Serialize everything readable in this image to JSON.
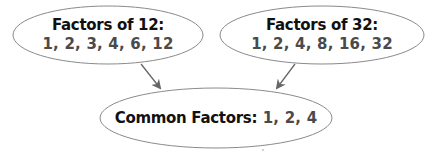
{
  "diagram": {
    "nodes": [
      {
        "id": "factors-12",
        "title": "Factors of 12:",
        "values": "1, 2, 3, 4, 6, 12"
      },
      {
        "id": "factors-32",
        "title": "Factors of 32:",
        "values": "1, 2, 4, 8, 16, 32"
      },
      {
        "id": "common",
        "title": "Common Factors:",
        "values": "1, 2, 4"
      }
    ],
    "edges": [
      {
        "from": "factors-12",
        "to": "common"
      },
      {
        "from": "factors-32",
        "to": "common"
      }
    ],
    "colors": {
      "outline": "#8a8a8a",
      "arrow": "#666666",
      "title": "#111111",
      "values": "#4a4a4a"
    }
  }
}
